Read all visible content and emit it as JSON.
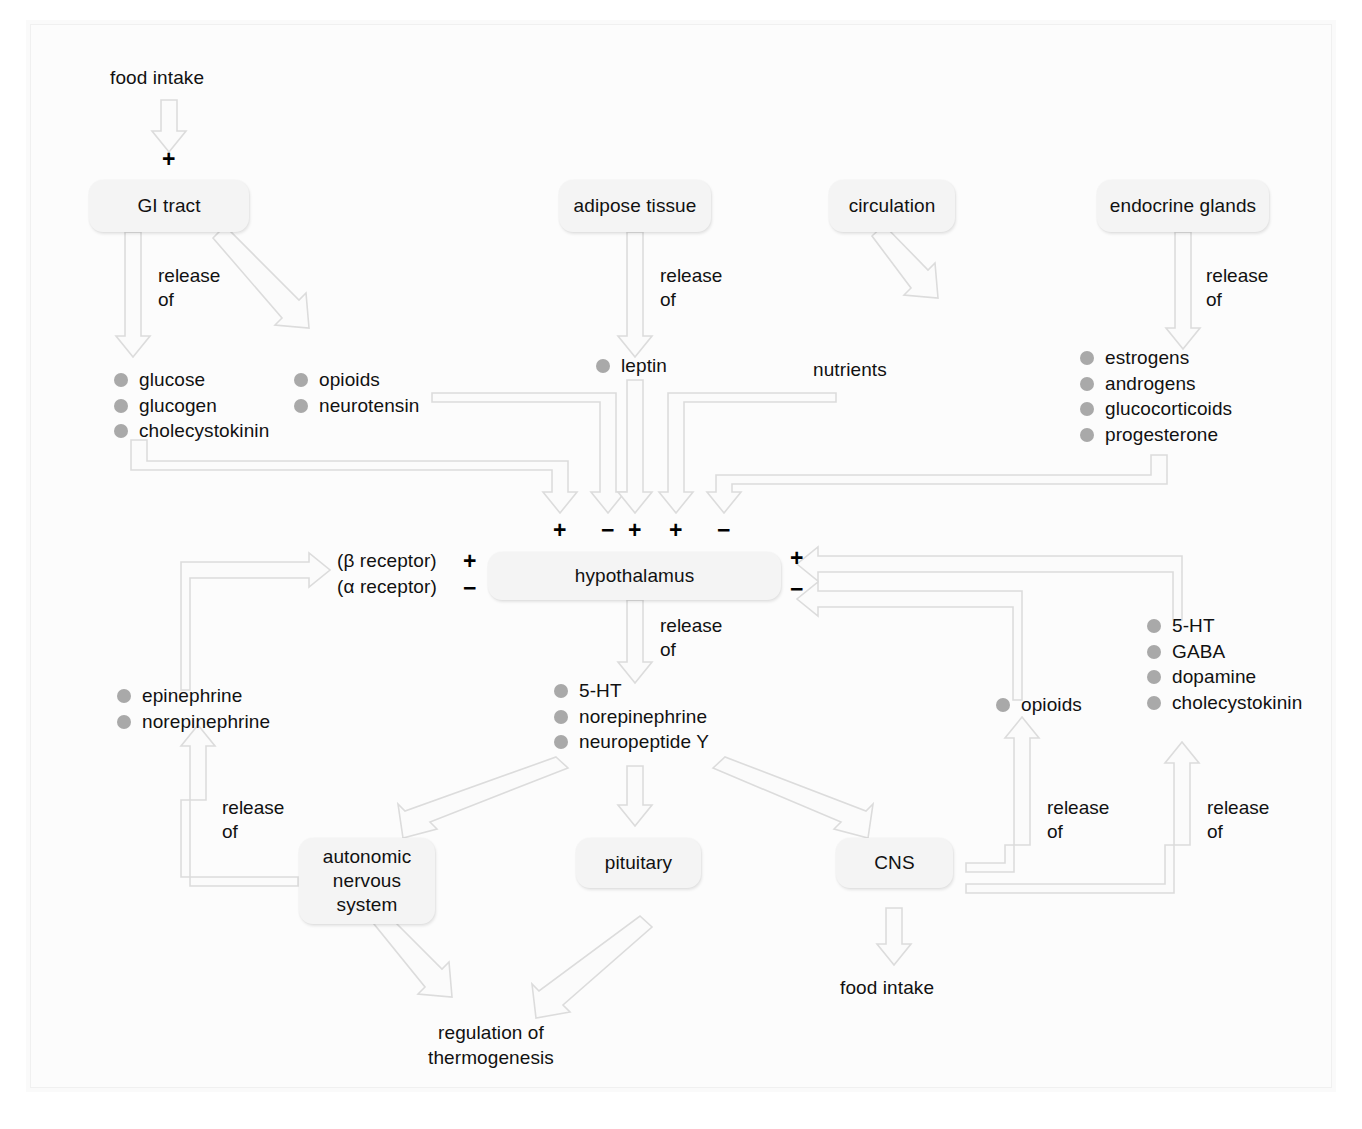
{
  "diagram": {
    "colors": {
      "background": "#ffffff",
      "panel": "#fcfcfc",
      "node_fill": "#f4f4f4",
      "arrow_stroke": "#d8d8d8",
      "bullet": "#a9a9a9",
      "text": "#111111"
    },
    "labels": {
      "release_of": "release\nof",
      "release": "release",
      "of": "of"
    },
    "nodes": [
      {
        "id": "gi-tract",
        "label": "GI tract"
      },
      {
        "id": "adipose-tissue",
        "label": "adipose tissue"
      },
      {
        "id": "circulation",
        "label": "circulation"
      },
      {
        "id": "endocrine-glands",
        "label": "endocrine glands"
      },
      {
        "id": "hypothalamus",
        "label": "hypothalamus"
      },
      {
        "id": "autonomic-nervous-system",
        "label": "autonomic\nnervous\nsystem"
      },
      {
        "id": "pituitary",
        "label": "pituitary"
      },
      {
        "id": "cns",
        "label": "CNS"
      }
    ],
    "free_text": {
      "food_intake_top": "food intake",
      "food_intake_bottom": "food intake",
      "nutrients": "nutrients",
      "regulation_of_thermogenesis": "regulation of\nthermogenesis",
      "beta_receptor": "(β receptor)",
      "alpha_receptor": "(α receptor)"
    },
    "signs": {
      "food_intake_to_gi": "+",
      "hypothalamus_inputs": [
        "+",
        "−",
        "+",
        "+",
        "−"
      ],
      "beta_receptor_sign": "+",
      "alpha_receptor_sign": "−",
      "cns_feedback_plus": "+",
      "cns_feedback_minus": "−"
    },
    "chem_groups": [
      {
        "id": "gi-hormones-left",
        "items": [
          {
            "label": "glucose",
            "bullet": true
          },
          {
            "label": "glucogen",
            "bullet": true
          },
          {
            "label": "cholecystokinin",
            "bullet": true
          }
        ]
      },
      {
        "id": "gi-peptides-right",
        "items": [
          {
            "label": "opioids",
            "bullet": true
          },
          {
            "label": "neurotensin",
            "bullet": true
          }
        ]
      },
      {
        "id": "adipose-product",
        "items": [
          {
            "label": "leptin",
            "bullet": true
          }
        ]
      },
      {
        "id": "circulation-product",
        "items": [
          {
            "label": "nutrients",
            "bullet": false
          }
        ]
      },
      {
        "id": "endocrine-hormones",
        "items": [
          {
            "label": "estrogens",
            "bullet": true
          },
          {
            "label": "androgens",
            "bullet": true
          },
          {
            "label": "glucocorticoids",
            "bullet": true
          },
          {
            "label": "progesterone",
            "bullet": true
          }
        ]
      },
      {
        "id": "hypothalamus-transmitters",
        "items": [
          {
            "label": "5-HT",
            "bullet": true
          },
          {
            "label": "norepinephrine",
            "bullet": true
          },
          {
            "label": "neuropeptide Y",
            "bullet": true
          }
        ]
      },
      {
        "id": "ans-catecholamines",
        "items": [
          {
            "label": "epinephrine",
            "bullet": true
          },
          {
            "label": "norepinephrine",
            "bullet": true
          }
        ]
      },
      {
        "id": "cns-opioids",
        "items": [
          {
            "label": "opioids",
            "bullet": true
          }
        ]
      },
      {
        "id": "cns-transmitters",
        "items": [
          {
            "label": "5-HT",
            "bullet": true
          },
          {
            "label": "GABA",
            "bullet": true
          },
          {
            "label": "dopamine",
            "bullet": true
          },
          {
            "label": "cholecystokinin",
            "bullet": true
          }
        ]
      }
    ],
    "release_labels": [
      {
        "id": "gi-release",
        "text_line1": "release",
        "text_line2": "of"
      },
      {
        "id": "adipose-release",
        "text_line1": "release",
        "text_line2": "of"
      },
      {
        "id": "endocrine-release",
        "text_line1": "release",
        "text_line2": "of"
      },
      {
        "id": "hypothalamus-release",
        "text_line1": "release",
        "text_line2": "of"
      },
      {
        "id": "ans-release",
        "text_line1": "release",
        "text_line2": "of"
      },
      {
        "id": "cns-opioid-release",
        "text_line1": "release",
        "text_line2": "of"
      },
      {
        "id": "cns-transmitter-release",
        "text_line1": "release",
        "text_line2": "of"
      }
    ]
  }
}
